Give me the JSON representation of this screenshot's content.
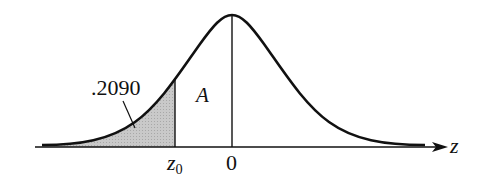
{
  "diagram": {
    "type": "standard normal curve",
    "axis_label": "z",
    "tick_labels": {
      "z0": "z",
      "z0_sub": "0",
      "zero": "0"
    },
    "shaded_area_label": ".2090",
    "unshaded_area_label": "A",
    "colors": {
      "curve": "#111111",
      "shade": "#c8c8c8",
      "axis": "#111111"
    }
  }
}
